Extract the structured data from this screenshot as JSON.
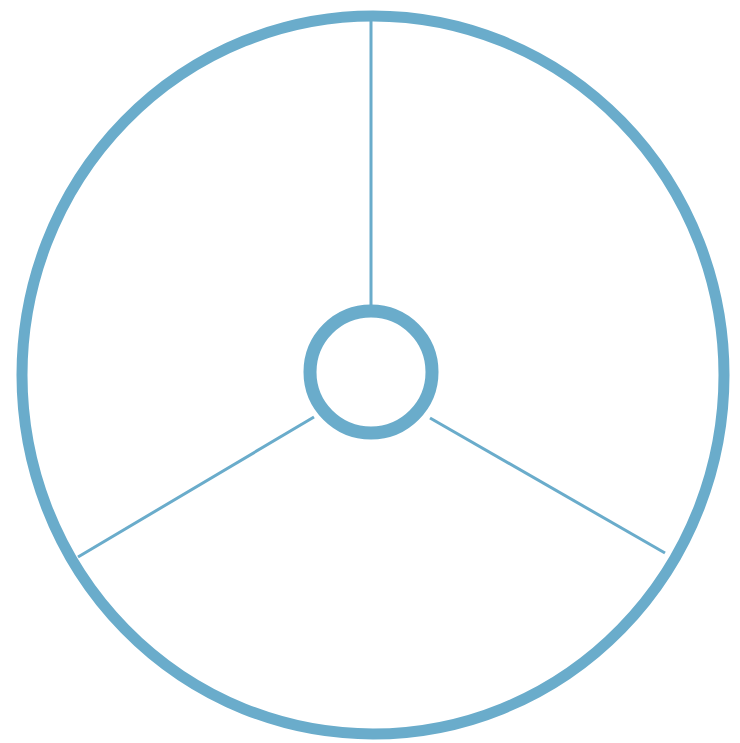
{
  "diagram": {
    "type": "wheel-three-spokes",
    "stroke_color": "#6aaccb",
    "background": "#ffffff",
    "outer_circle": {
      "cx": 373,
      "cy": 375,
      "rx": 351,
      "ry": 359,
      "stroke_width": 11
    },
    "inner_circle": {
      "cx": 371,
      "cy": 372,
      "r": 61,
      "stroke_width": 13
    },
    "spokes": [
      {
        "name": "top",
        "x1": 371,
        "y1": 18,
        "x2": 371,
        "y2": 305
      },
      {
        "name": "lower-left",
        "x1": 314,
        "y1": 417,
        "x2": 78,
        "y2": 557
      },
      {
        "name": "lower-right",
        "x1": 430,
        "y1": 418,
        "x2": 665,
        "y2": 553
      }
    ],
    "spoke_width": 3
  }
}
